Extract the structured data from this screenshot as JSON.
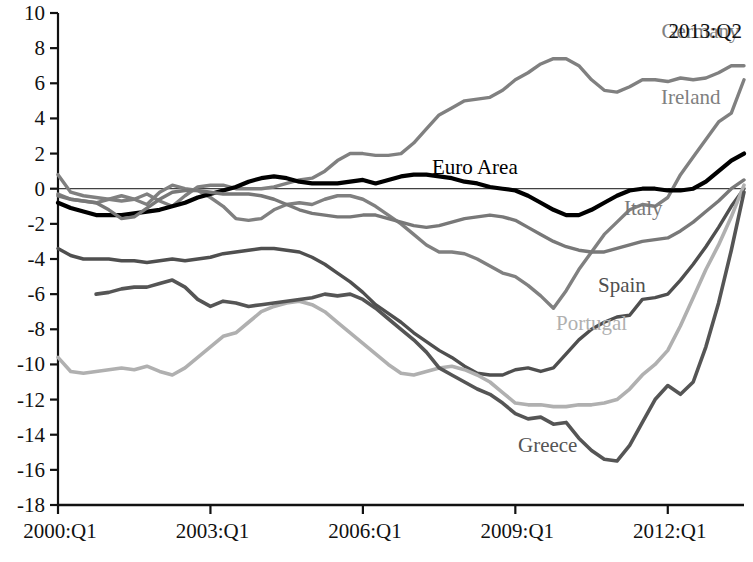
{
  "chart_data": {
    "type": "line",
    "title": "",
    "xlabel": "",
    "ylabel": "",
    "corner_annotation": "2013:Q2",
    "ylim": [
      -18,
      10
    ],
    "ytick_labels": [
      "10",
      "8",
      "6",
      "4",
      "2",
      "0",
      "-2",
      "-4",
      "-6",
      "-8",
      "-10",
      "-12",
      "-14",
      "-16",
      "-18"
    ],
    "yticks": [
      10,
      8,
      6,
      4,
      2,
      0,
      -2,
      -4,
      -6,
      -8,
      -10,
      -12,
      -14,
      -16,
      -18
    ],
    "xtick_labels": [
      "2000:Q1",
      "2003:Q1",
      "2006:Q1",
      "2009:Q1",
      "2012:Q1"
    ],
    "xticks": [
      0,
      12,
      24,
      36,
      48
    ],
    "xlim": [
      0,
      54
    ],
    "grid": false,
    "legend": "inline-annotations",
    "x_quarters": [
      0,
      1,
      2,
      3,
      4,
      5,
      6,
      7,
      8,
      9,
      10,
      11,
      12,
      13,
      14,
      15,
      16,
      17,
      18,
      19,
      20,
      21,
      22,
      23,
      24,
      25,
      26,
      27,
      28,
      29,
      30,
      31,
      32,
      33,
      34,
      35,
      36,
      37,
      38,
      39,
      40,
      41,
      42,
      43,
      44,
      45,
      46,
      47,
      48,
      49,
      50,
      51,
      52,
      53,
      54
    ],
    "series": [
      {
        "name": "Germany",
        "color": "#808080",
        "width": 3.4,
        "label_x": 47.5,
        "label_y": 38,
        "values": [
          0.8,
          -0.2,
          -0.4,
          -0.5,
          -0.6,
          -0.7,
          -0.6,
          -0.3,
          -0.7,
          -1.0,
          -0.4,
          0.1,
          0.2,
          0.2,
          0.0,
          0.0,
          0.0,
          0.1,
          0.3,
          0.5,
          0.6,
          1.0,
          1.6,
          2.0,
          2.0,
          1.9,
          1.9,
          2.0,
          2.6,
          3.4,
          4.2,
          4.6,
          5.0,
          5.1,
          5.2,
          5.6,
          6.2,
          6.6,
          7.1,
          7.4,
          7.4,
          7.0,
          6.2,
          5.6,
          5.5,
          5.8,
          6.2,
          6.2,
          6.1,
          6.3,
          6.2,
          6.3,
          6.6,
          7.0,
          7.0
        ]
      },
      {
        "name": "Ireland",
        "color": "#808080",
        "width": 3.4,
        "label_x": 661,
        "label_y": 104,
        "values": [
          -0.3,
          -0.6,
          -0.7,
          -0.8,
          -0.6,
          -0.4,
          -0.6,
          -0.9,
          -0.2,
          0.2,
          0.0,
          -0.1,
          -0.5,
          -1.0,
          -1.7,
          -1.8,
          -1.7,
          -1.2,
          -0.9,
          -0.8,
          -0.9,
          -0.6,
          -0.4,
          -0.4,
          -0.6,
          -1.0,
          -1.5,
          -2.0,
          -2.6,
          -3.2,
          -3.6,
          -3.6,
          -3.7,
          -4.0,
          -4.4,
          -4.8,
          -5.0,
          -5.5,
          -6.1,
          -6.8,
          -5.8,
          -4.6,
          -3.6,
          -2.6,
          -1.9,
          -1.2,
          -0.9,
          -1.0,
          -0.5,
          0.8,
          1.8,
          2.8,
          3.8,
          4.3,
          6.2
        ]
      },
      {
        "name": "Euro Area",
        "color": "#000000",
        "width": 4.2,
        "label_x": 432,
        "label_y": 174,
        "values": [
          -0.8,
          -1.1,
          -1.3,
          -1.5,
          -1.5,
          -1.5,
          -1.4,
          -1.3,
          -1.2,
          -1.0,
          -0.8,
          -0.5,
          -0.3,
          -0.1,
          0.1,
          0.4,
          0.6,
          0.7,
          0.6,
          0.4,
          0.3,
          0.3,
          0.3,
          0.4,
          0.5,
          0.3,
          0.5,
          0.7,
          0.8,
          0.8,
          0.7,
          0.6,
          0.4,
          0.3,
          0.1,
          0.0,
          -0.1,
          -0.4,
          -0.8,
          -1.2,
          -1.5,
          -1.5,
          -1.2,
          -0.8,
          -0.4,
          -0.1,
          0.0,
          0.0,
          -0.1,
          -0.1,
          0.0,
          0.4,
          1.0,
          1.6,
          2.0
        ]
      },
      {
        "name": "Italy",
        "color": "#787878",
        "width": 3.4,
        "label_x": 624,
        "label_y": 215,
        "values": [
          -0.4,
          -0.6,
          -0.7,
          -0.8,
          -1.2,
          -1.7,
          -1.6,
          -1.1,
          -0.6,
          -0.2,
          -0.1,
          -0.1,
          -0.2,
          -0.3,
          -0.3,
          -0.3,
          -0.4,
          -0.6,
          -0.9,
          -1.2,
          -1.4,
          -1.5,
          -1.6,
          -1.6,
          -1.5,
          -1.5,
          -1.7,
          -1.9,
          -2.1,
          -2.2,
          -2.1,
          -1.9,
          -1.7,
          -1.6,
          -1.5,
          -1.6,
          -1.8,
          -2.2,
          -2.6,
          -3.0,
          -3.3,
          -3.5,
          -3.6,
          -3.6,
          -3.4,
          -3.2,
          -3.0,
          -2.9,
          -2.8,
          -2.4,
          -1.9,
          -1.3,
          -0.7,
          0.0,
          0.5
        ]
      },
      {
        "name": "Spain",
        "color": "#4f4f4f",
        "width": 3.4,
        "label_x": 598,
        "label_y": 292,
        "values": [
          -3.4,
          -3.8,
          -4.0,
          -4.0,
          -4.0,
          -4.1,
          -4.1,
          -4.2,
          -4.1,
          -4.0,
          -4.1,
          -4.0,
          -3.9,
          -3.7,
          -3.6,
          -3.5,
          -3.4,
          -3.4,
          -3.5,
          -3.6,
          -3.9,
          -4.3,
          -4.8,
          -5.3,
          -5.9,
          -6.6,
          -7.1,
          -7.6,
          -8.2,
          -8.7,
          -9.2,
          -9.6,
          -10.1,
          -10.5,
          -10.6,
          -10.6,
          -10.3,
          -10.2,
          -10.4,
          -10.2,
          -9.4,
          -8.6,
          -8.0,
          -7.6,
          -7.3,
          -7.2,
          -6.3,
          -6.2,
          -6.0,
          -5.2,
          -4.3,
          -3.3,
          -2.2,
          -1.0,
          0.0
        ]
      },
      {
        "name": "Portugal",
        "color": "#b0b0b0",
        "width": 3.6,
        "label_x": 556,
        "label_y": 330,
        "values": [
          -9.6,
          -10.4,
          -10.5,
          -10.4,
          -10.3,
          -10.2,
          -10.3,
          -10.1,
          -10.4,
          -10.6,
          -10.2,
          -9.6,
          -9.0,
          -8.4,
          -8.2,
          -7.6,
          -7.0,
          -6.7,
          -6.5,
          -6.4,
          -6.6,
          -7.0,
          -7.6,
          -8.2,
          -8.8,
          -9.4,
          -10.0,
          -10.5,
          -10.6,
          -10.4,
          -10.2,
          -10.1,
          -10.3,
          -10.6,
          -11.0,
          -11.6,
          -12.2,
          -12.3,
          -12.3,
          -12.4,
          -12.4,
          -12.3,
          -12.3,
          -12.2,
          -12.0,
          -11.4,
          -10.6,
          -10.0,
          -9.2,
          -7.8,
          -6.2,
          -4.6,
          -3.2,
          -1.6,
          0.2
        ]
      },
      {
        "name": "Greece",
        "color": "#555555",
        "width": 3.6,
        "label_x": 518,
        "label_y": 452,
        "values": [
          null,
          null,
          null,
          -6.0,
          -5.9,
          -5.7,
          -5.6,
          -5.6,
          -5.4,
          -5.2,
          -5.6,
          -6.3,
          -6.7,
          -6.4,
          -6.5,
          -6.7,
          -6.6,
          -6.5,
          -6.4,
          -6.3,
          -6.2,
          -6.0,
          -6.1,
          -6.0,
          -6.3,
          -6.8,
          -7.4,
          -8.0,
          -8.6,
          -9.3,
          -10.2,
          -10.6,
          -11.0,
          -11.4,
          -11.7,
          -12.2,
          -12.8,
          -13.1,
          -13.0,
          -13.4,
          -13.3,
          -14.2,
          -14.9,
          -15.4,
          -15.5,
          -14.6,
          -13.3,
          -12.0,
          -11.2,
          -11.7,
          -11.0,
          -9.0,
          -6.5,
          -3.5,
          -0.2
        ]
      }
    ]
  }
}
